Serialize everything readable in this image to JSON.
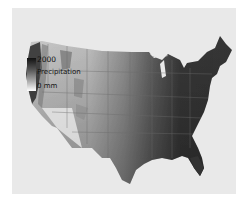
{
  "map": {
    "region": "Contiguous United States",
    "variable": "Precipitation",
    "shading": "grayscale, darker = more precipitation",
    "colors": {
      "background": "#e9e9e9",
      "high": "#111111",
      "low": "#ffffff",
      "state_lines": "#6a6a6a"
    }
  },
  "legend": {
    "max_label": "2000",
    "title": "Precipitation",
    "min_label": "0 mm"
  }
}
